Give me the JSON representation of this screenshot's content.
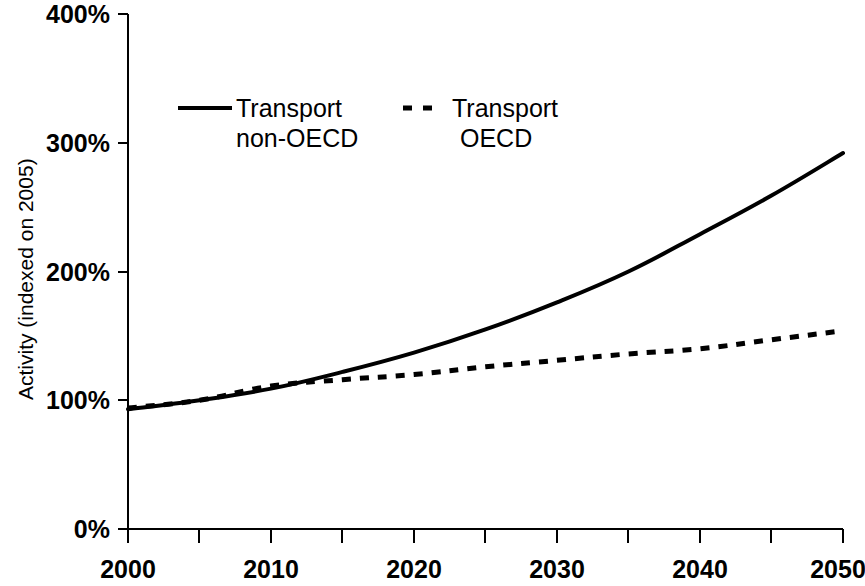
{
  "chart_data": {
    "type": "line",
    "title": "",
    "xlabel": "",
    "ylabel": "Activity (indexed on 2005)",
    "xlim": [
      2000,
      2050
    ],
    "ylim": [
      0,
      400
    ],
    "grid": false,
    "legend_position": "top-inside",
    "x_tick_labels": [
      "2000",
      "2010",
      "2020",
      "2030",
      "2040",
      "2050"
    ],
    "x_major_ticks": [
      2000,
      2010,
      2020,
      2030,
      2040,
      2050
    ],
    "x_minor_ticks": [
      2005,
      2015,
      2025,
      2035,
      2045
    ],
    "y_tick_labels": [
      "0%",
      "100%",
      "200%",
      "300%",
      "400%"
    ],
    "y_ticks": [
      0,
      100,
      200,
      300,
      400
    ],
    "y_unit": "%",
    "x": [
      2000,
      2005,
      2010,
      2015,
      2020,
      2025,
      2030,
      2035,
      2040,
      2045,
      2050
    ],
    "series": [
      {
        "name": "Transport non-OECD",
        "style": "solid",
        "color": "#000000",
        "values": [
          93,
          100,
          109,
          122,
          137,
          155,
          176,
          200,
          229,
          259,
          292
        ]
      },
      {
        "name": "Transport OECD",
        "style": "dashed",
        "color": "#000000",
        "values": [
          94,
          100,
          111,
          116,
          120,
          126,
          131,
          136,
          140,
          147,
          154
        ]
      }
    ]
  },
  "axes": {
    "y_title": "Activity (indexed on 2005)",
    "y_labels": [
      "400%",
      "300%",
      "200%",
      "100%",
      "0%"
    ],
    "x_labels": [
      "2000",
      "2010",
      "2020",
      "2030",
      "2040",
      "2050"
    ]
  },
  "legend": {
    "entries": [
      {
        "line1": "Transport",
        "line2": "non-OECD",
        "style": "solid"
      },
      {
        "line1": "Transport",
        "line2": "OECD",
        "style": "dashed"
      }
    ]
  }
}
